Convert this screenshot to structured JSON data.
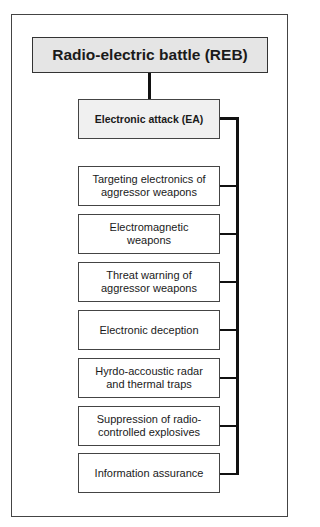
{
  "diagram": {
    "root": {
      "label": "Radio-electric battle (REB)"
    },
    "branch": {
      "label": "Electronic attack (EA)"
    },
    "children": [
      {
        "label": "Targeting electronics of aggressor weapons"
      },
      {
        "label": "Electromagnetic weapons"
      },
      {
        "label": "Threat warning of aggressor weapons"
      },
      {
        "label": "Electronic deception"
      },
      {
        "label": "Hyrdo-accoustic radar and thermal traps"
      },
      {
        "label": "Suppression of radio-controlled explosives"
      },
      {
        "label": "Information assurance"
      }
    ],
    "colors": {
      "root_fill": "#e5e5e5",
      "branch_fill": "#f0f0f0",
      "child_fill": "#ffffff",
      "line": "#111111"
    }
  }
}
